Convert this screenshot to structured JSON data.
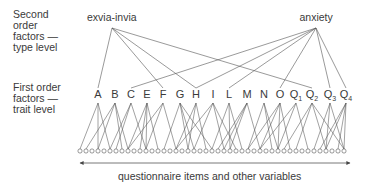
{
  "left_labels": {
    "second_order": "Second\norder\nfactors —\ntype level",
    "first_order": "First order\nfactors —\ntrait level"
  },
  "second_order_factors": [
    {
      "name": "exvia-invia",
      "x": 112,
      "y": 28,
      "connects": [
        "A",
        "F",
        "H",
        "Q2"
      ]
    },
    {
      "name": "anxiety",
      "x": 316,
      "y": 28,
      "connects": [
        "C",
        "H",
        "L",
        "O",
        "Q3",
        "Q4"
      ]
    }
  ],
  "first_order_factors": [
    {
      "id": "A",
      "base": "A",
      "sub": "",
      "x": 98
    },
    {
      "id": "B",
      "base": "B",
      "sub": "",
      "x": 115
    },
    {
      "id": "C",
      "base": "C",
      "sub": "",
      "x": 131
    },
    {
      "id": "E",
      "base": "E",
      "sub": "",
      "x": 147
    },
    {
      "id": "F",
      "base": "F",
      "sub": "",
      "x": 163
    },
    {
      "id": "G",
      "base": "G",
      "sub": "",
      "x": 180
    },
    {
      "id": "H",
      "base": "H",
      "sub": "",
      "x": 196
    },
    {
      "id": "I",
      "base": "I",
      "sub": "",
      "x": 213
    },
    {
      "id": "L",
      "base": "L",
      "sub": "",
      "x": 229
    },
    {
      "id": "M",
      "base": "M",
      "sub": "",
      "x": 247
    },
    {
      "id": "N",
      "base": "N",
      "sub": "",
      "x": 264
    },
    {
      "id": "O",
      "base": "O",
      "sub": "",
      "x": 280
    },
    {
      "id": "Q1",
      "base": "Q",
      "sub": "1",
      "x": 296
    },
    {
      "id": "Q2",
      "base": "Q",
      "sub": "2",
      "x": 312
    },
    {
      "id": "Q3",
      "base": "Q",
      "sub": "3",
      "x": 330
    },
    {
      "id": "Q4",
      "base": "Q",
      "sub": "4",
      "x": 346
    }
  ],
  "items": {
    "count": 45,
    "start_x": 80,
    "spacing": 6,
    "y": 151
  },
  "caption": "questionnaire items and other variables",
  "colors": {
    "line": "#555555",
    "text": "#3a3a3a"
  }
}
